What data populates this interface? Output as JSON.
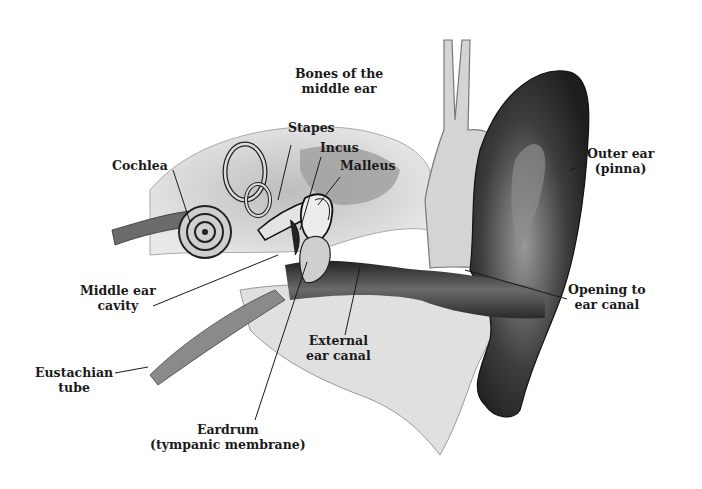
{
  "diagram": {
    "labels": {
      "bones_line1": "Bones of the",
      "bones_line2": "middle ear",
      "stapes": "Stapes",
      "incus": "Incus",
      "malleus": "Malleus",
      "cochlea": "Cochlea",
      "outer_line1": "Outer ear",
      "outer_line2": "(pinna)",
      "middle_cavity_line1": "Middle ear",
      "middle_cavity_line2": "cavity",
      "opening_line1": "Opening to",
      "opening_line2": "ear canal",
      "external_line1": "External",
      "external_line2": "ear canal",
      "eustachian_line1": "Eustachian",
      "eustachian_line2": "tube",
      "eardrum_line1": "Eardrum",
      "eardrum_line2": "(tympanic membrane)"
    },
    "colors": {
      "ink": "#1a1a1a",
      "bone_light": "#e6e6e6",
      "bone_mid": "#c8c8c8",
      "tissue_dark": "#3a3a3a",
      "pinna_dark": "#2b2b2b",
      "canal": "#4a4a4a"
    }
  }
}
